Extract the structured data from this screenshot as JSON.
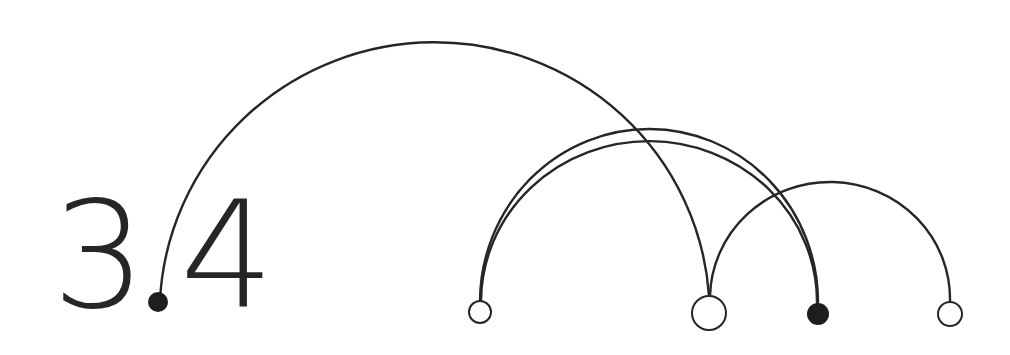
{
  "label": {
    "left_digit": "3",
    "right_digit": "4"
  },
  "colors": {
    "stroke": "#262626",
    "fill_dark": "#1e1e1e",
    "fill_light": "#ffffff",
    "background": "#ffffff"
  },
  "nodes": [
    {
      "id": "dot",
      "cx": 158,
      "cy": 302,
      "r": 10,
      "filled": true
    },
    {
      "id": "n1",
      "cx": 480,
      "cy": 312,
      "r": 11,
      "filled": false
    },
    {
      "id": "n2",
      "cx": 709,
      "cy": 313,
      "r": 17,
      "filled": false
    },
    {
      "id": "n3",
      "cx": 818,
      "cy": 314,
      "r": 11,
      "filled": true
    },
    {
      "id": "n4",
      "cx": 950,
      "cy": 314,
      "r": 12,
      "filled": false
    }
  ],
  "arcs": [
    {
      "from": "dot",
      "to": "n2",
      "top_y": 29
    },
    {
      "from": "n1",
      "to": "n3",
      "top_y": 128
    },
    {
      "from": "n1",
      "to": "n3",
      "top_y": 140
    },
    {
      "from": "n2",
      "to": "n4",
      "top_y": 180
    }
  ]
}
